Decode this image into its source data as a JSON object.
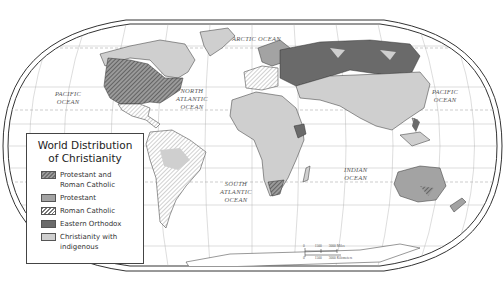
{
  "map": {
    "title_line1": "World Distribution",
    "title_line2": "of Christianity",
    "projection": "Robinson-style oval world map",
    "colors": {
      "protestant_and_roman_catholic": "#7a7a7a",
      "protestant": "#a3a3a3",
      "roman_catholic": "#ffffff",
      "eastern_orthodox": "#6a6a6a",
      "christianity_with_indigenous": "#cfcfcf",
      "ocean": "#ffffff",
      "border": "#333333"
    },
    "ocean_labels": [
      {
        "id": "arctic",
        "line1": "ARCTIC OCEAN",
        "line2": "",
        "line3": ""
      },
      {
        "id": "pacific-west",
        "line1": "PACIFIC",
        "line2": "OCEAN",
        "line3": ""
      },
      {
        "id": "north-atlantic",
        "line1": "NORTH",
        "line2": "ATLANTIC",
        "line3": "OCEAN"
      },
      {
        "id": "pacific-east",
        "line1": "PACIFIC",
        "line2": "OCEAN",
        "line3": ""
      },
      {
        "id": "south-atlantic",
        "line1": "SOUTH",
        "line2": "ATLANTIC",
        "line3": "OCEAN"
      },
      {
        "id": "indian",
        "line1": "INDIAN",
        "line2": "OCEAN",
        "line3": ""
      }
    ],
    "legend": {
      "items": [
        {
          "key": "protestant_and_roman_catholic",
          "line1": "Protestant and",
          "line2": "Roman Catholic",
          "pattern": "dark-hatched"
        },
        {
          "key": "protestant",
          "line1": "Protestant",
          "line2": "",
          "pattern": "solid-medium-gray"
        },
        {
          "key": "roman_catholic",
          "line1": "Roman Catholic",
          "line2": "",
          "pattern": "white-hatched"
        },
        {
          "key": "eastern_orthodox",
          "line1": "Eastern Orthodox",
          "line2": "",
          "pattern": "solid-dark-gray"
        },
        {
          "key": "christianity_with_indigenous",
          "line1": "Christianity with",
          "line2": "indigenous",
          "pattern": "solid-light-gray"
        }
      ]
    },
    "scale_bar": {
      "miles": [
        "0",
        "1500",
        "3000 Miles"
      ],
      "kilometers": [
        "0",
        "1500",
        "3000 Kilometers"
      ]
    }
  }
}
